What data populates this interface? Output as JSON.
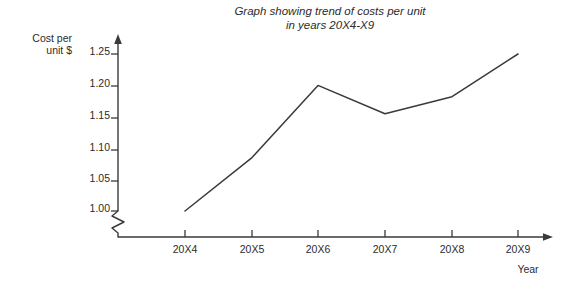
{
  "chart_data": {
    "type": "line",
    "title": "Graph showing trend of costs per unit in years 20X4-X9",
    "title_lines": [
      "Graph showing trend of costs per unit",
      "in years 20X4-X9"
    ],
    "xlabel": "Year",
    "ylabel": "Cost per unit $",
    "ylabel_lines": [
      "Cost per",
      "unit $"
    ],
    "categories": [
      "20X4",
      "20X5",
      "20X6",
      "20X7",
      "20X8",
      "20X9"
    ],
    "values": [
      1.0,
      1.085,
      1.2,
      1.155,
      1.182,
      1.25
    ],
    "ytick_labels": [
      "1.25",
      "1.20",
      "1.15",
      "1.10",
      "1.05",
      "1.00"
    ],
    "ytick_values": [
      1.25,
      1.2,
      1.15,
      1.1,
      1.05,
      1.0
    ],
    "ylim": [
      1.0,
      1.27
    ],
    "axis_break": true,
    "axis_break_note": "zigzag break on y-axis below 1.00",
    "grid": false,
    "legend": false,
    "line_color": "#3a3a3a",
    "axis_color": "#3a3a3a",
    "background_color": "#ffffff",
    "markers": false
  }
}
